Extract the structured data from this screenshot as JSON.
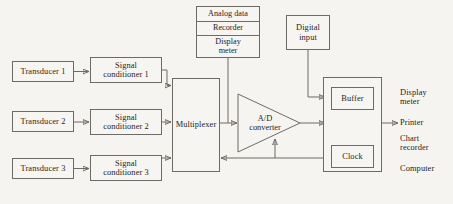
{
  "diagram": {
    "background_color": "#f6f4f0",
    "line_color": "#6e6a66",
    "blocks": {
      "transducer_1": "Transducer 1",
      "transducer_2": "Transducer 2",
      "transducer_3": "Transducer 3",
      "conditioner_1": "Signal\nconditioner 1",
      "conditioner_2": "Signal\nconditioner 2",
      "conditioner_3": "Signal\nconditioner 3",
      "multiplexer": "Multiplexer",
      "ad_converter": "A/D\nconverter",
      "digital_input": "Digital\ninput",
      "buffer": "Buffer",
      "clock": "Clock"
    },
    "analog_stack": {
      "row_1": "Analog data",
      "row_2": "Recorder",
      "row_3": "Display\nmeter"
    },
    "outputs": [
      "Display\nmeter",
      "Printer",
      "Chart\nrecorder",
      "Computer"
    ]
  }
}
